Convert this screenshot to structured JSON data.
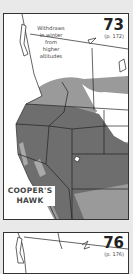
{
  "maps": [
    {
      "number": "73",
      "page_ref": "(p. 172)",
      "annotation": "Withdraws in winter from higher altitudes",
      "annotation_lines": [
        "Withdraws",
        "in winter",
        "from",
        "higher",
        "altitudes"
      ],
      "species_lines": [
        "COOPER'S",
        "HAWK"
      ],
      "colors": {
        "year_round": "#6e6e6e",
        "summer": "#9a9a9a",
        "winter": "#b9b9b9",
        "border": "#222222"
      }
    },
    {
      "number": "76",
      "page_ref": "(p. 176)"
    }
  ]
}
